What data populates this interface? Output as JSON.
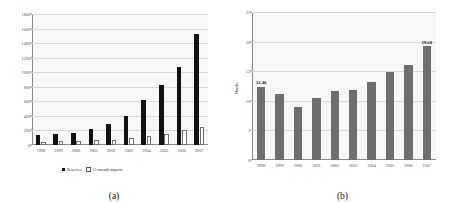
{
  "figure": {
    "panels": [
      {
        "caption": "(a)",
        "chart_ref": 0
      },
      {
        "caption": "(b)",
        "chart_ref": 1
      }
    ]
  },
  "chart_data": [
    {
      "type": "bar",
      "title": "",
      "xlabel": "",
      "ylabel": "",
      "ylim": [
        0,
        1800
      ],
      "yticks": [
        0,
        200,
        400,
        600,
        800,
        1000,
        1200,
        1400,
        1600,
        1800
      ],
      "grid": true,
      "legend_position": "bottom",
      "categories": [
        "1998",
        "1999",
        "2000",
        "2001",
        "2002",
        "2003",
        "2004",
        "2005",
        "2006",
        "2007"
      ],
      "series": [
        {
          "name": "Reserves",
          "style": "solid-black",
          "values": [
            140,
            150,
            165,
            215,
            290,
            405,
            615,
            820,
            1070,
            1530
          ]
        },
        {
          "name": "12-month imports",
          "style": "hollow-white",
          "values": [
            35,
            55,
            60,
            65,
            70,
            95,
            130,
            145,
            205,
            250
          ]
        }
      ]
    },
    {
      "type": "bar",
      "title": "",
      "xlabel": "",
      "ylabel": "Months",
      "ylim": [
        0,
        25
      ],
      "yticks": [
        0,
        5,
        10,
        15,
        20,
        25
      ],
      "grid": true,
      "legend_position": "none",
      "categories": [
        "1998",
        "1999",
        "2000",
        "2001",
        "2002",
        "2003",
        "2004",
        "2005",
        "2006",
        "2007"
      ],
      "series": [
        {
          "name": "Months of import cover",
          "style": "solid-gray",
          "values": [
            12.4,
            11.2,
            8.9,
            10.4,
            11.7,
            11.8,
            13.1,
            14.9,
            16.1,
            19.2
          ]
        }
      ],
      "annotations": [
        {
          "category": "1998",
          "text": "12.40",
          "value": 12.4
        },
        {
          "category": "2007",
          "text": "19.20",
          "value": 19.2
        }
      ]
    }
  ],
  "colors": {
    "bar_solid": "#111111",
    "bar_gray": "#6e6e6e",
    "plot_background": "#f7f7f7",
    "gridline": "#d8d8d8",
    "axis": "#8a8a8a"
  }
}
